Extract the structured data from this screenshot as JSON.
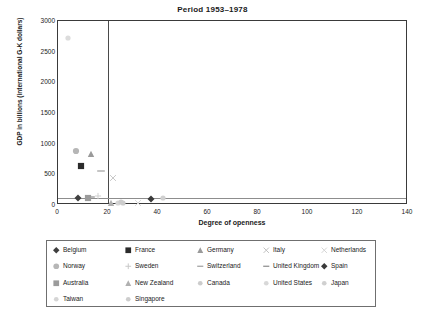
{
  "chart_data": {
    "type": "scatter",
    "title": "Period 1953–1978",
    "xlabel": "Degree of openness",
    "ylabel": "GDP in billions (international G-K dollars)",
    "xlim": [
      0,
      140
    ],
    "ylim": [
      0,
      3000
    ],
    "xticks": [
      0,
      20,
      40,
      60,
      80,
      100,
      120,
      140
    ],
    "yticks": [
      0,
      500,
      1000,
      1500,
      2000,
      2500,
      3000
    ],
    "grid": false,
    "legend_position": "below-plot",
    "reference_lines": [
      {
        "name": "openness-threshold",
        "orientation": "vertical",
        "x": 20
      },
      {
        "name": "gdp-baseline",
        "orientation": "horizontal",
        "y": 120
      }
    ],
    "series": [
      {
        "name": "Belgium",
        "marker": "diamond",
        "color": "#3f3f3f",
        "x": 8,
        "y": 110
      },
      {
        "name": "France",
        "marker": "square",
        "color": "#2b2b2b",
        "x": 9,
        "y": 630
      },
      {
        "name": "Germany",
        "marker": "triangle",
        "color": "#9a9a9a",
        "x": 13,
        "y": 830
      },
      {
        "name": "Italy",
        "marker": "cross",
        "color": "#c8c8c8",
        "x": 22,
        "y": 440
      },
      {
        "name": "Netherlands",
        "marker": "cross",
        "color": "#d8d8d8",
        "x": 32,
        "y": 35
      },
      {
        "name": "Norway",
        "marker": "circle",
        "color": "#b6b6b6",
        "x": 7,
        "y": 880
      },
      {
        "name": "Sweden",
        "marker": "plus",
        "color": "#cfcfcf",
        "x": 16,
        "y": 150
      },
      {
        "name": "Switzerland",
        "marker": "dash",
        "color": "#9e9e9e",
        "x": 17,
        "y": 560
      },
      {
        "name": "United Kingdom",
        "marker": "dash",
        "color": "#8a8a8a",
        "x": 13,
        "y": 130
      },
      {
        "name": "Spain",
        "marker": "diamond",
        "color": "#3a3a3a",
        "x": 37,
        "y": 105
      },
      {
        "name": "Australia",
        "marker": "square",
        "color": "#9b9b9b",
        "x": 12,
        "y": 120
      },
      {
        "name": "New Zealand",
        "marker": "triangle",
        "color": "#b0b0b0",
        "x": 21,
        "y": 30
      },
      {
        "name": "Canada",
        "marker": "dot",
        "color": "#cccccc",
        "x": 26,
        "y": 40
      },
      {
        "name": "United States",
        "marker": "dot",
        "color": "#dcdcdc",
        "x": 4,
        "y": 2720
      },
      {
        "name": "Japan",
        "marker": "dot",
        "color": "#d0d0d0",
        "x": 42,
        "y": 120
      },
      {
        "name": "Taiwan",
        "marker": "dot",
        "color": "#d5d5d5",
        "x": 24,
        "y": 25
      },
      {
        "name": "Singapore",
        "marker": "dot",
        "color": "#cdcdcd",
        "x": 25,
        "y": 55
      }
    ]
  },
  "legend": {
    "rows": [
      [
        {
          "label": "Belgium",
          "marker": "diamond",
          "color": "#3f3f3f"
        },
        {
          "label": "France",
          "marker": "square",
          "color": "#2b2b2b"
        },
        {
          "label": "Germany",
          "marker": "triangle",
          "color": "#9a9a9a"
        },
        {
          "label": "Italy",
          "marker": "cross",
          "color": "#c0c0c0"
        },
        {
          "label": "Netherlands",
          "marker": "cross",
          "color": "#d4d4d4"
        }
      ],
      [
        {
          "label": "Norway",
          "marker": "circle",
          "color": "#b6b6b6"
        },
        {
          "label": "Sweden",
          "marker": "plus",
          "color": "#c8c8c8"
        },
        {
          "label": "Switzerland",
          "marker": "dash",
          "color": "#9e9e9e"
        },
        {
          "label": "United Kingdom",
          "marker": "dash",
          "color": "#8a8a8a"
        },
        {
          "label": "Spain",
          "marker": "diamond",
          "color": "#3a3a3a"
        }
      ],
      [
        {
          "label": "Australia",
          "marker": "square",
          "color": "#9b9b9b"
        },
        {
          "label": "New Zealand",
          "marker": "triangle",
          "color": "#b0b0b0"
        },
        {
          "label": "Canada",
          "marker": "dot",
          "color": "#cccccc"
        },
        {
          "label": "United States",
          "marker": "dot",
          "color": "#d8d8d8"
        },
        {
          "label": "Japan",
          "marker": "dot",
          "color": "#d0d0d0"
        }
      ],
      [
        {
          "label": "Taiwan",
          "marker": "dot",
          "color": "#d5d5d5"
        },
        {
          "label": "Singapore",
          "marker": "dot",
          "color": "#cdcdcd"
        }
      ]
    ]
  }
}
